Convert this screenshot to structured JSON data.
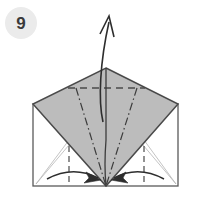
{
  "figure": {
    "type": "origami-instruction-diagram",
    "step_badge": {
      "label": "9",
      "shape": "circle",
      "fill_color": "#ebebeb",
      "text_color": "#3a3a3a",
      "center_x": 21,
      "center_y": 23,
      "radius": 16
    },
    "canvas": {
      "width": 201,
      "height": 198,
      "background_color": "#ffffff"
    },
    "colors": {
      "paper_shaded": "#bcbcbc",
      "paper_white": "#ffffff",
      "outline_dark": "#4a4a4a",
      "outline_light": "#a8a8a8",
      "crease_dashed": "#555555",
      "crease_dashdot": "#3c3c3c",
      "arrow": "#2e2e2e"
    },
    "base_square": {
      "name": "square-outline",
      "left": 33,
      "top": 104,
      "right": 178,
      "bottom": 186
    },
    "diamond": {
      "name": "shaded-diamond-flap",
      "apex_x": 106,
      "apex_y": 68,
      "left_x": 33,
      "left_y": 104,
      "right_x": 178,
      "right_y": 104,
      "bottom_x": 106,
      "bottom_y": 186
    },
    "creases": [
      {
        "name": "horizontal-valley-fold",
        "style": "dashed",
        "x1": 68,
        "y1": 88,
        "x2": 145,
        "y2": 88
      },
      {
        "name": "left-mountain-fold",
        "style": "dash-dot",
        "x1": 76,
        "y1": 88,
        "x2": 106,
        "y2": 186
      },
      {
        "name": "right-mountain-fold",
        "style": "dash-dot",
        "x1": 137,
        "y1": 88,
        "x2": 106,
        "y2": 186
      },
      {
        "name": "left-vertical-valley-fold",
        "style": "dashed",
        "x1": 69,
        "y1": 150,
        "x2": 69,
        "y2": 186
      },
      {
        "name": "right-vertical-valley-fold",
        "style": "dashed",
        "x1": 144,
        "y1": 150,
        "x2": 144,
        "y2": 186
      },
      {
        "name": "center-vertical-line",
        "style": "solid",
        "x1": 106,
        "y1": 68,
        "x2": 106,
        "y2": 186
      }
    ],
    "arrows": [
      {
        "name": "lift-up-arrow",
        "direction": "up",
        "style": "curved-open-head",
        "start_x": 104,
        "start_y": 120,
        "end_x": 109,
        "end_y": 16
      },
      {
        "name": "left-fold-arrow",
        "direction": "right",
        "style": "curved-solid-head",
        "start_x": 48,
        "start_y": 178,
        "end_x": 99,
        "end_y": 180
      },
      {
        "name": "right-fold-arrow",
        "direction": "left",
        "style": "curved-solid-head",
        "start_x": 163,
        "start_y": 178,
        "end_x": 113,
        "end_y": 180
      }
    ],
    "thin_guides": [
      {
        "name": "left-inner-guide-a",
        "x1": 36,
        "y1": 184,
        "x2": 69,
        "y2": 140
      },
      {
        "name": "left-inner-guide-b",
        "x1": 36,
        "y1": 184,
        "x2": 80,
        "y2": 133
      },
      {
        "name": "right-inner-guide-a",
        "x1": 176,
        "y1": 184,
        "x2": 144,
        "y2": 140
      },
      {
        "name": "right-inner-guide-b",
        "x1": 176,
        "y1": 184,
        "x2": 132,
        "y2": 133
      }
    ]
  }
}
